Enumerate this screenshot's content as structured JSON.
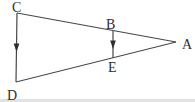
{
  "figure": {
    "width": 195,
    "height": 102,
    "background": "#ffffff",
    "bottom_edge_color": "#e2e2e2",
    "stroke_color": "#474747",
    "stroke_width": 1.2,
    "arrow_color": "#2e2e2e",
    "label_color": "#2e2e2e",
    "points": {
      "A": {
        "label": "A",
        "x": 176,
        "y": 42,
        "label_x": 182,
        "label_y": 49
      },
      "B": {
        "label": "B",
        "x": 113,
        "y": 31,
        "label_x": 106,
        "label_y": 29
      },
      "C": {
        "label": "C",
        "x": 17,
        "y": 13,
        "label_x": 12,
        "label_y": 12
      },
      "D": {
        "label": "D",
        "x": 16,
        "y": 82,
        "label_x": 7,
        "label_y": 100
      },
      "E": {
        "label": "E",
        "x": 113,
        "y": 58,
        "label_x": 108,
        "label_y": 72
      }
    },
    "segments": [
      {
        "from": "C",
        "to": "A",
        "arrow_mid": false
      },
      {
        "from": "D",
        "to": "A",
        "arrow_mid": false
      },
      {
        "from": "C",
        "to": "D",
        "arrow_mid": true
      },
      {
        "from": "B",
        "to": "E",
        "arrow_mid": true
      }
    ]
  }
}
